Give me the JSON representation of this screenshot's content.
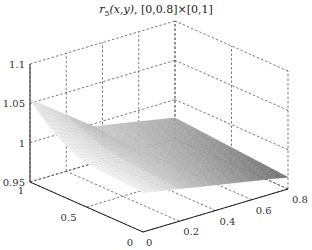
{
  "chart_data": {
    "type": "surface3d",
    "title": "r5(x,y), [0,0.8]×[0,1]",
    "title_parts": {
      "func": "r",
      "sub": "5",
      "args": "(x,y)",
      "domain": ", [0,0.8]×[0,1]"
    },
    "xlabel": "",
    "ylabel": "",
    "zlabel": "",
    "xlim": [
      0,
      0.8
    ],
    "ylim": [
      0,
      1
    ],
    "zlim": [
      0.95,
      1.1
    ],
    "x_ticks": [
      "0",
      "0.2",
      "0.4",
      "0.6",
      "0.8"
    ],
    "y_ticks": [
      "0",
      "0.5",
      "1"
    ],
    "z_ticks": [
      "0.95",
      "1",
      "1.05",
      "1.1"
    ],
    "grid": true,
    "colormap": "gray",
    "surface_samples": [
      {
        "x": 0.0,
        "y": 1.0,
        "z": 1.055
      },
      {
        "x": 0.0,
        "y": 0.5,
        "z": 1.01
      },
      {
        "x": 0.0,
        "y": 0.0,
        "z": 1.0
      },
      {
        "x": 0.4,
        "y": 1.0,
        "z": 1.0
      },
      {
        "x": 0.4,
        "y": 0.0,
        "z": 0.99
      },
      {
        "x": 0.8,
        "y": 1.0,
        "z": 0.98
      },
      {
        "x": 0.8,
        "y": 0.0,
        "z": 0.965
      }
    ]
  }
}
